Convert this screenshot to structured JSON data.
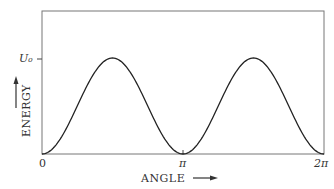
{
  "chart_data": {
    "type": "line",
    "title": "",
    "xlabel": "ANGLE",
    "ylabel": "ENERGY",
    "x_ticks": [
      "0",
      "π",
      "2π"
    ],
    "y_ticks": [
      "U₀"
    ],
    "xlim": [
      0,
      6.2832
    ],
    "ylim": [
      0,
      1.2
    ],
    "grid": false,
    "legend": null,
    "series": [
      {
        "name": "energy",
        "formula": "U0/2 * (1 - cos(2*angle))",
        "x": [
          0,
          0.785,
          1.571,
          2.356,
          3.142,
          3.927,
          4.712,
          5.498,
          6.283
        ],
        "y": [
          0,
          0.5,
          1.0,
          0.5,
          0,
          0.5,
          1.0,
          0.5,
          0
        ]
      }
    ]
  },
  "labels": {
    "x_axis": "ANGLE",
    "y_axis": "ENERGY",
    "tick_0": "0",
    "tick_pi": "π",
    "tick_2pi": "2π",
    "tick_u0": "U₀"
  }
}
